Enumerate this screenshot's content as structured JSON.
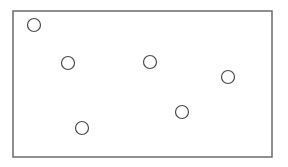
{
  "diagram": {
    "frame": {
      "x": 13,
      "y": 11,
      "width": 259,
      "height": 146,
      "stroke": "#6b6b6b"
    },
    "circle_style": {
      "radius": 6.5,
      "stroke": "#4a4a4a",
      "fill": "#ffffff"
    },
    "circles": [
      {
        "cx": 34,
        "cy": 25
      },
      {
        "cx": 68,
        "cy": 63
      },
      {
        "cx": 150,
        "cy": 62
      },
      {
        "cx": 228,
        "cy": 77
      },
      {
        "cx": 182,
        "cy": 112
      },
      {
        "cx": 82,
        "cy": 128
      }
    ]
  }
}
